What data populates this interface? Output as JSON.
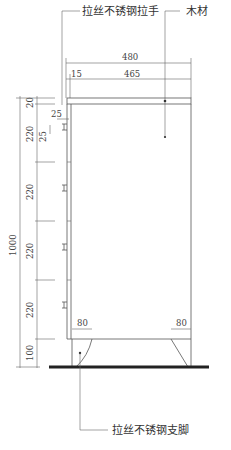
{
  "labels": {
    "handle": "拉丝不锈钢拉手",
    "wood": "木材",
    "leg": "拉丝不锈钢支脚"
  },
  "dimensions": {
    "total_width": "480",
    "panel_offset": "15",
    "inner_width": "465",
    "total_height": "1000",
    "top_board": "20",
    "drawer_1": "220",
    "drawer_2": "220",
    "drawer_3": "220",
    "drawer_4": "220",
    "base": "100",
    "handle_offset_h": "25",
    "handle_offset_v": "25",
    "leg_left": "80",
    "leg_right": "80"
  },
  "colors": {
    "line": "#555555",
    "ground": "#222222",
    "text": "#333333"
  }
}
